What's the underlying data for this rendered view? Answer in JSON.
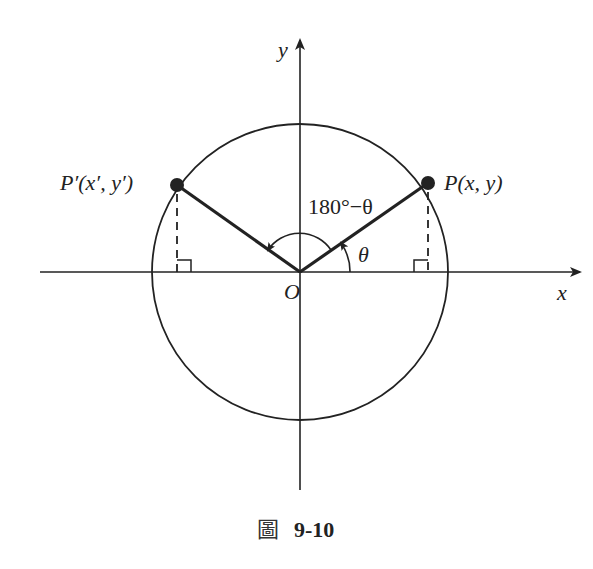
{
  "diagram": {
    "labels": {
      "y_axis": "y",
      "x_axis": "x",
      "origin": "O",
      "point_p": "P(x,  y)",
      "point_p_prime": "P′(x′,  y′)",
      "angle_theta": "θ",
      "angle_supplement": "180°−θ"
    },
    "elements": {
      "unit_circle": "circle centered at origin",
      "segment_op": "radius to P in quadrant I",
      "segment_op_prime": "radius to P′ in quadrant II",
      "perpendicular_p": "dashed perpendicular from P to x-axis with right-angle mark",
      "perpendicular_p_prime": "dashed perpendicular from P′ to x-axis with right-angle mark",
      "arc_theta": "arc with arrow from x-axis to OP",
      "arc_supplement": "arc with arrow from OP to OP′"
    },
    "colors": {
      "stroke": "#222222",
      "background": "#ffffff"
    }
  },
  "caption": {
    "prefix": "圖",
    "number": "9-10"
  }
}
